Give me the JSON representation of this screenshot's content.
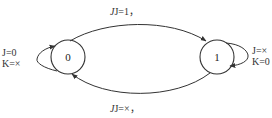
{
  "diagram": {
    "type": "state-diagram",
    "states": [
      {
        "id": "s0",
        "label": "0"
      },
      {
        "id": "s1",
        "label": "1"
      }
    ],
    "transitions": [
      {
        "from": "0",
        "to": "1",
        "J": "1",
        "K": "×",
        "label_j": "J=1，",
        "label_k": "K=×"
      },
      {
        "from": "1",
        "to": "0",
        "J": "×",
        "K": "1",
        "label_j": "J=×，",
        "label_k": "K=1"
      },
      {
        "from": "0",
        "to": "0",
        "J": "0",
        "K": "×",
        "label_j": "J=0",
        "label_k": "K=×"
      },
      {
        "from": "1",
        "to": "1",
        "J": "×",
        "K": "0",
        "label_j": "J=×",
        "label_k": "K=0"
      }
    ],
    "colors": {
      "stroke": "#333333",
      "text": "#333333",
      "background": "#ffffff"
    }
  }
}
